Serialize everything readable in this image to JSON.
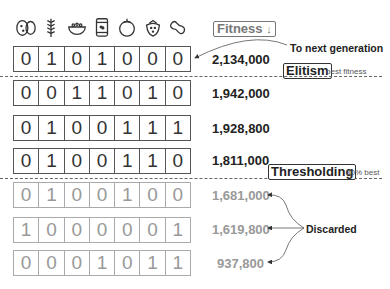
{
  "header": {
    "fitness_label": "Fitness",
    "fitness_sort_icon": "down-arrow",
    "gene_icons": [
      "potatoes-icon",
      "wheat-icon",
      "salad-bowl-icon",
      "beans-can-icon",
      "tomato-icon",
      "strawberry-icon",
      "peanut-icon"
    ]
  },
  "population": [
    {
      "genes": [
        "0",
        "1",
        "0",
        "1",
        "0",
        "0",
        "0"
      ],
      "fitness": "2,134,000",
      "status": "elite"
    },
    {
      "genes": [
        "0",
        "0",
        "1",
        "1",
        "0",
        "1",
        "0"
      ],
      "fitness": "1,942,000",
      "status": "kept"
    },
    {
      "genes": [
        "0",
        "1",
        "0",
        "0",
        "1",
        "1",
        "1"
      ],
      "fitness": "1,928,800",
      "status": "kept"
    },
    {
      "genes": [
        "0",
        "1",
        "0",
        "0",
        "1",
        "1",
        "0"
      ],
      "fitness": "1,811,000",
      "status": "kept"
    },
    {
      "genes": [
        "0",
        "1",
        "0",
        "0",
        "1",
        "0",
        "0"
      ],
      "fitness": "1,681,000",
      "status": "discarded"
    },
    {
      "genes": [
        "1",
        "0",
        "0",
        "0",
        "0",
        "0",
        "1"
      ],
      "fitness": "1,619,800",
      "status": "discarded"
    },
    {
      "genes": [
        "0",
        "0",
        "0",
        "1",
        "0",
        "1",
        "1"
      ],
      "fitness": "937,800",
      "status": "discarded"
    }
  ],
  "annotations": {
    "next_generation": "To next generation",
    "elitism_label": "Elitism",
    "elitism_note": "best fitness",
    "thresholding_label": "Thresholding",
    "thresholding_note": "80% best",
    "discarded": "Discarded"
  },
  "colors": {
    "kept_text": "#222222",
    "discarded_text": "#999999"
  }
}
